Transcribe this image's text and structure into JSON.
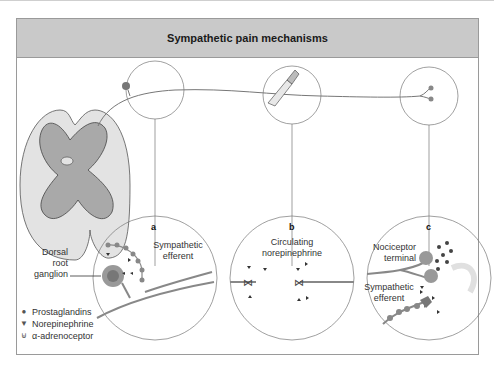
{
  "figure": {
    "title": "Sympathetic pain mechanisms",
    "panels": [
      {
        "letter": "a",
        "labels": [
          "Sympathetic efferent",
          "Dorsal root ganglion"
        ]
      },
      {
        "letter": "b",
        "labels": [
          "Circulating norepinephrine"
        ]
      },
      {
        "letter": "c",
        "labels": [
          "Nociceptor terminal",
          "Sympathetic efferent"
        ]
      }
    ],
    "panel_a": {
      "letter": "a",
      "label_efferent_1": "Sympathetic",
      "label_efferent_2": "efferent",
      "drg_1": "Dorsal",
      "drg_2": "root",
      "drg_3": "ganglion"
    },
    "panel_b": {
      "letter": "b",
      "label_1": "Circulating",
      "label_2": "norepinephrine"
    },
    "panel_c": {
      "letter": "c",
      "noci_1": "Nociceptor",
      "noci_2": "terminal",
      "symp_1": "Sympathetic",
      "symp_2": "efferent"
    },
    "legend": [
      {
        "icon": "circle-dot",
        "label": "Prostaglandins"
      },
      {
        "icon": "triangle-down",
        "label": "Norepinephrine"
      },
      {
        "icon": "receptor-cup",
        "label": "α-adrenoceptor"
      }
    ],
    "colors": {
      "header": "#c9c9c9",
      "cord_outer": "#e3e3e3",
      "cord_inner": "#a9a9a9",
      "nerve": "#8a8a8a",
      "dot": "#555555"
    }
  }
}
